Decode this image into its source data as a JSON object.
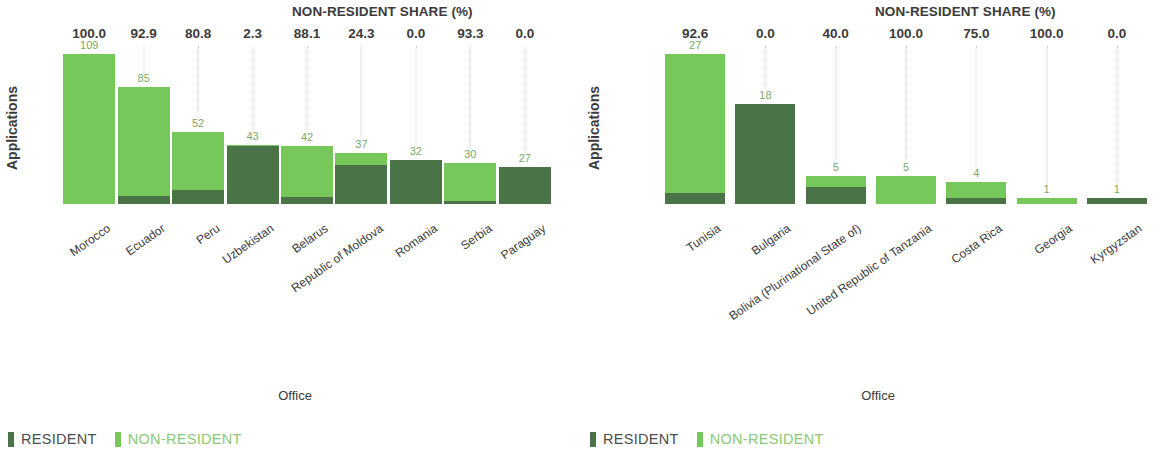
{
  "colors": {
    "resident": "#4a7348",
    "non_resident": "#76c85a",
    "text": "#3b3b3b",
    "total_label": "#7aa86a",
    "gridline": "#cfcfcf"
  },
  "legend": {
    "items": [
      {
        "label": "RESIDENT",
        "color_key": "resident"
      },
      {
        "label": "NON-RESIDENT",
        "color_key": "non_resident"
      }
    ]
  },
  "panels": [
    {
      "id": "left",
      "share_header": "NON-RESIDENT SHARE (%)",
      "y_axis_title": "Applications",
      "x_axis_title": "Office",
      "chart_data": {
        "type": "bar",
        "subtype": "stacked",
        "title": "NON-RESIDENT SHARE (%)",
        "xlabel": "Office",
        "ylabel": "Applications",
        "ylim": [
          0,
          109
        ],
        "grid": "vertical-dotted",
        "legend_position": "bottom-left",
        "categories": [
          "Morocco",
          "Ecuador",
          "Peru",
          "Uzbekistan",
          "Belarus",
          "Republic of Moldova",
          "Romania",
          "Serbia",
          "Paraguay"
        ],
        "totals": [
          109,
          85,
          52,
          43,
          42,
          37,
          32,
          30,
          27
        ],
        "non_resident_share_pct": [
          100.0,
          92.9,
          80.8,
          2.3,
          88.1,
          24.3,
          0.0,
          93.3,
          0.0
        ],
        "series": [
          {
            "name": "NON-RESIDENT",
            "values": [
              109,
              79,
              42,
              1,
              37,
              9,
              0,
              28,
              0
            ]
          },
          {
            "name": "RESIDENT",
            "values": [
              0,
              6,
              10,
              42,
              5,
              28,
              32,
              2,
              27
            ]
          }
        ]
      }
    },
    {
      "id": "right",
      "share_header": "NON-RESIDENT SHARE (%)",
      "y_axis_title": "Applications",
      "x_axis_title": "Office",
      "chart_data": {
        "type": "bar",
        "subtype": "stacked",
        "title": "NON-RESIDENT SHARE (%)",
        "xlabel": "Office",
        "ylabel": "Applications",
        "ylim": [
          0,
          27
        ],
        "grid": "vertical-dotted",
        "legend_position": "bottom-left",
        "categories": [
          "Tunisia",
          "Bulgaria",
          "Bolivia (Plurinational State of)",
          "United Republic of Tanzania",
          "Costa Rica",
          "Georgia",
          "Kyrgyzstan"
        ],
        "totals": [
          27,
          18,
          5,
          5,
          4,
          1,
          1
        ],
        "non_resident_share_pct": [
          92.6,
          0.0,
          40.0,
          100.0,
          75.0,
          100.0,
          0.0
        ],
        "series": [
          {
            "name": "NON-RESIDENT",
            "values": [
              25,
              0,
              2,
              5,
              3,
              1,
              0
            ]
          },
          {
            "name": "RESIDENT",
            "values": [
              2,
              18,
              3,
              0,
              1,
              0,
              1
            ]
          }
        ]
      }
    }
  ]
}
